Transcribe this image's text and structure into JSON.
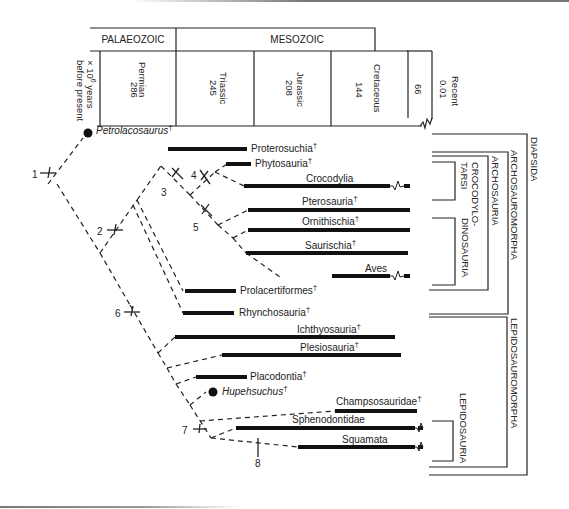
{
  "header": {
    "eras": [
      {
        "label": "PALAEOZOIC"
      },
      {
        "label": "MESOZOIC"
      }
    ],
    "axis_label_line1": "× 10",
    "axis_label_sup": "6",
    "axis_label_rest": " years",
    "axis_label_line2": "before present",
    "periods": [
      {
        "name": "Permian",
        "age": "286"
      },
      {
        "name": "Triassic",
        "age": "245"
      },
      {
        "name": "Jurassic",
        "age": "208"
      },
      {
        "name": "Cretaceous",
        "age": "144"
      },
      {
        "name": "",
        "age": "66"
      }
    ],
    "recent": {
      "name": "Recent",
      "age": "0.01"
    }
  },
  "taxa": {
    "petrolacosaurus": "Petrolacosaurus",
    "proterosuchia": "Proterosuchia",
    "phytosauria": "Phytosauria",
    "crocodylia": "Crocodylia",
    "pterosauria": "Pterosauria",
    "ornithischia": "Ornithischia",
    "saurischia": "Saurischia",
    "aves": "Aves",
    "prolacertiformes": "Prolacertiformes",
    "rhynchosauria": "Rhynchosauria",
    "ichthyosauria": "Ichthyosauria",
    "plesiosauria": "Plesiosauria",
    "placodontia": "Placodontia",
    "hupehsuchus": "Hupehsuchus",
    "champsosauridae": "Champsosauridae",
    "sphenodontidae": "Sphenodontidae",
    "squamata": "Squamata"
  },
  "dagger": "†",
  "nodes": [
    "1",
    "2",
    "3",
    "4",
    "5",
    "6",
    "7",
    "8"
  ],
  "groups": {
    "diapsida": "DIAPSIDA",
    "archosauromorpha": "ARCHOSAUROMORPHA",
    "archosauria": "ARCHOSAURIA",
    "crocodylotarsi_1": "CROCODYLO-",
    "crocodylotarsi_2": "TARSI",
    "dinosauria": "DINOSAURIA",
    "lepidosauromorpha": "LEPIDOSAUROMORPHA",
    "lepidosauria": "LEPIDOSAURIA"
  },
  "colors": {
    "line": "#222222",
    "background": "#ffffff"
  }
}
